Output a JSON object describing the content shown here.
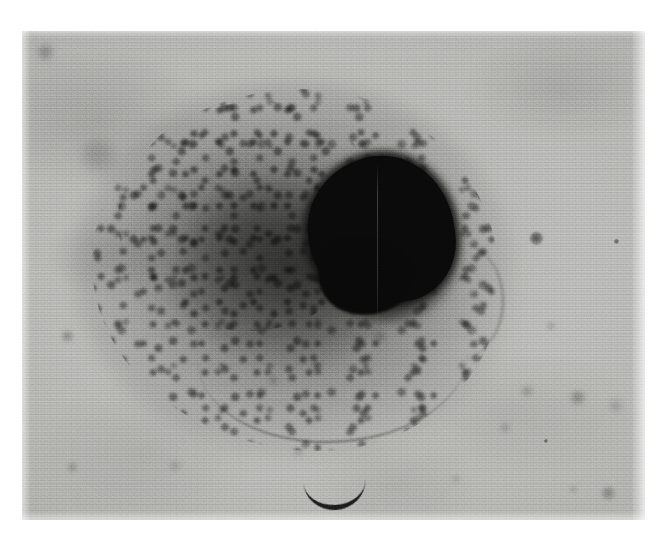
{
  "figure": {
    "kind": "photomicrograph",
    "caption": "",
    "plate": {
      "left": 22,
      "top": 31,
      "width": 623,
      "height": 489,
      "page_background": "#ffffff",
      "film_base_color": "#bdbdba"
    },
    "palette": {
      "page_white": "#ffffff",
      "background_gray": "#bdbdba",
      "background_light": "#d2d2cf",
      "background_dark": "#a2a29f",
      "cytoplasm_gray": "#8a8a88",
      "granule_dark": "#4a4a48",
      "nucleus_black": "#0a0a0a",
      "bacillus_dark": "#262624"
    },
    "subjects": [
      {
        "name": "cell-body",
        "label": "cell",
        "center_x": 272,
        "center_y": 240,
        "width": 400,
        "height": 355,
        "tone": "#8a8a88"
      },
      {
        "name": "nucleus",
        "label": "nucleus",
        "center_x": 359,
        "center_y": 199,
        "width": 146,
        "height": 148,
        "tone": "#0a0a0a"
      },
      {
        "name": "granular-cytoplasm",
        "label": "granular cytoplasm",
        "tone": "#4a4a48"
      },
      {
        "name": "bacillus",
        "label": "curved bacillus",
        "center_x": 313,
        "center_y": 461,
        "width": 62,
        "height": 26,
        "tone": "#262624"
      }
    ],
    "specks": [
      {
        "x": 16,
        "y": 14,
        "size": 15,
        "opacity": 0.42,
        "blur": 3.0
      },
      {
        "x": 60,
        "y": 108,
        "size": 34,
        "opacity": 0.26,
        "blur": 6.0
      },
      {
        "x": 40,
        "y": 300,
        "size": 11,
        "opacity": 0.4,
        "blur": 2.2
      },
      {
        "x": 46,
        "y": 432,
        "size": 9,
        "opacity": 0.34,
        "blur": 2.0
      },
      {
        "x": 508,
        "y": 201,
        "size": 13,
        "opacity": 0.8,
        "blur": 1.0
      },
      {
        "x": 592,
        "y": 208,
        "size": 5,
        "opacity": 0.7,
        "blur": 0.6
      },
      {
        "x": 525,
        "y": 291,
        "size": 8,
        "opacity": 0.28,
        "blur": 2.0
      },
      {
        "x": 549,
        "y": 360,
        "size": 14,
        "opacity": 0.4,
        "blur": 2.4
      },
      {
        "x": 500,
        "y": 355,
        "size": 11,
        "opacity": 0.3,
        "blur": 2.4
      },
      {
        "x": 588,
        "y": 369,
        "size": 12,
        "opacity": 0.28,
        "blur": 3.0
      },
      {
        "x": 522,
        "y": 408,
        "size": 4,
        "opacity": 0.72,
        "blur": 0.4
      },
      {
        "x": 478,
        "y": 392,
        "size": 10,
        "opacity": 0.26,
        "blur": 2.6
      },
      {
        "x": 580,
        "y": 456,
        "size": 13,
        "opacity": 0.42,
        "blur": 2.0
      },
      {
        "x": 548,
        "y": 455,
        "size": 7,
        "opacity": 0.26,
        "blur": 2.0
      },
      {
        "x": 290,
        "y": 330,
        "size": 10,
        "opacity": 0.35,
        "blur": 2.2
      },
      {
        "x": 247,
        "y": 345,
        "size": 9,
        "opacity": 0.3,
        "blur": 2.2
      },
      {
        "x": 148,
        "y": 430,
        "size": 10,
        "opacity": 0.24,
        "blur": 2.8
      },
      {
        "x": 272,
        "y": 416,
        "size": 9,
        "opacity": 0.26,
        "blur": 2.4
      },
      {
        "x": 430,
        "y": 444,
        "size": 8,
        "opacity": 0.22,
        "blur": 2.4
      },
      {
        "x": 352,
        "y": 300,
        "size": 12,
        "opacity": 0.3,
        "blur": 2.6
      }
    ]
  }
}
